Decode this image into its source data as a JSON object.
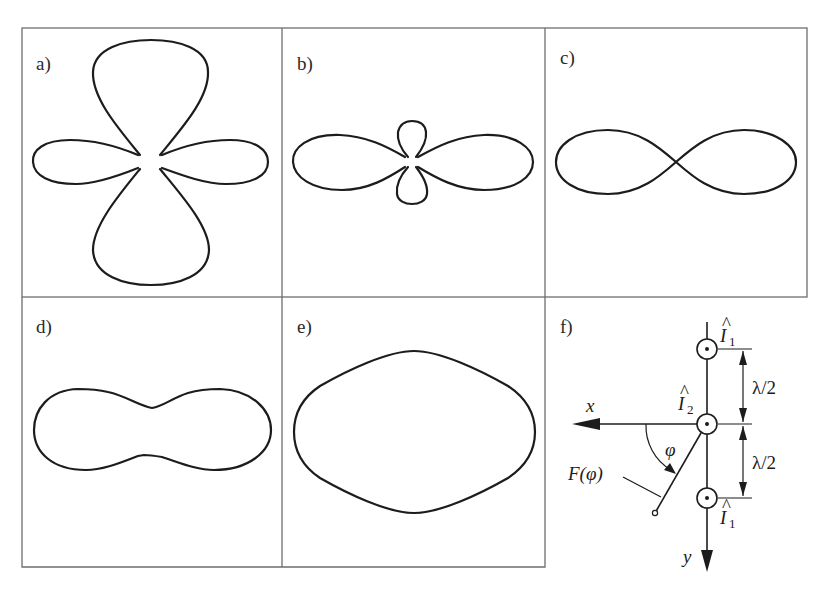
{
  "figure": {
    "panels": [
      {
        "id": "a",
        "label": "a)",
        "shape": "four-lobe pattern: large lobes on vertical axis, smaller lobes on horizontal axis"
      },
      {
        "id": "b",
        "label": "b)",
        "shape": "large horizontal lobes with small vertical lobes"
      },
      {
        "id": "c",
        "label": "c)",
        "shape": "figure-eight along horizontal axis"
      },
      {
        "id": "d",
        "label": "d)",
        "shape": "peanut / dumbbell shape along horizontal axis"
      },
      {
        "id": "e",
        "label": "e)",
        "shape": "nearly elliptical, wider horizontally"
      },
      {
        "id": "f",
        "label": "f)",
        "shape": "array geometry diagram"
      }
    ],
    "diagram_f": {
      "axis_x_label": "x",
      "axis_y_label": "y",
      "angle_label": "φ",
      "pattern_label": "F(φ)",
      "current_top": {
        "base": "I",
        "hat": "^",
        "subscript": "1"
      },
      "current_middle": {
        "base": "I",
        "hat": "^",
        "subscript": "2"
      },
      "current_bottom": {
        "base": "I",
        "hat": "^",
        "subscript": "1"
      },
      "spacing_upper": "λ/2",
      "spacing_lower": "λ/2"
    }
  }
}
